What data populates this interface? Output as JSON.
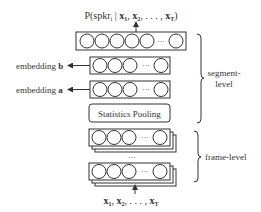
{
  "diagram": {
    "output_label": "P(spkr",
    "output_sub": "i",
    "output_given": " | ",
    "output_inputs": "x",
    "layers": {
      "output_layer": {
        "nodes": 5,
        "ellipsis": "···"
      },
      "embedding_b": {
        "label": "embedding ",
        "bold": "b",
        "nodes": 3,
        "ellipsis": "···"
      },
      "embedding_a": {
        "label": "embedding ",
        "bold": "a",
        "nodes": 3,
        "ellipsis": "···"
      },
      "pooling": {
        "label": "Statistics Pooling"
      },
      "frame_layer_1": {
        "nodes": 3,
        "ellipsis": "···"
      },
      "frame_layer_2": {
        "nodes": 3,
        "ellipsis": "···"
      },
      "between_ellipsis": "···"
    },
    "input_label": "x1, x2, ..., xT",
    "groups": {
      "segment_level": {
        "line1": "segment-",
        "line2": "level"
      },
      "frame_level": {
        "label": "frame-level"
      }
    }
  }
}
